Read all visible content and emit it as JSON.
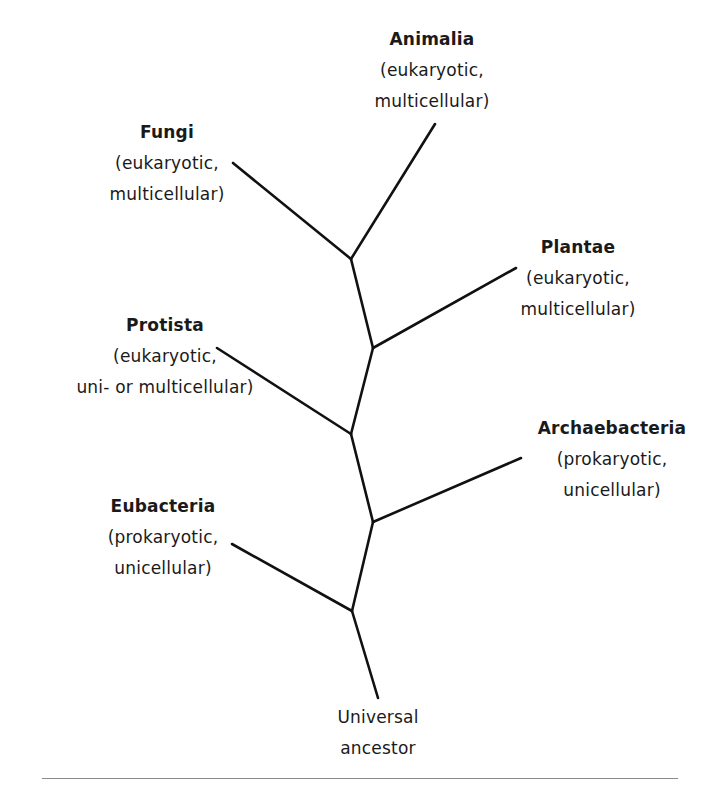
{
  "diagram": {
    "type": "phylogenetic-tree",
    "root": {
      "name": "Universal",
      "desc": "ancestor"
    },
    "kingdoms": [
      {
        "id": "animalia",
        "name": "Animalia",
        "line1": "(eukaryotic,",
        "line2": "multicellular)"
      },
      {
        "id": "fungi",
        "name": "Fungi",
        "line1": "(eukaryotic,",
        "line2": "multicellular)"
      },
      {
        "id": "plantae",
        "name": "Plantae",
        "line1": "(eukaryotic,",
        "line2": "multicellular)"
      },
      {
        "id": "protista",
        "name": "Protista",
        "line1": "(eukaryotic,",
        "line2": "uni- or multicellular)"
      },
      {
        "id": "archaebacteria",
        "name": "Archaebacteria",
        "line1": "(prokaryotic,",
        "line2": "unicellular)"
      },
      {
        "id": "eubacteria",
        "name": "Eubacteria",
        "line1": "(prokaryotic,",
        "line2": "unicellular)"
      }
    ],
    "branches": [
      {
        "from": "universal-ancestor",
        "to": "node-1"
      },
      {
        "from": "node-1",
        "to": "eubacteria"
      },
      {
        "from": "node-1",
        "to": "node-2"
      },
      {
        "from": "node-2",
        "to": "archaebacteria"
      },
      {
        "from": "node-2",
        "to": "node-3"
      },
      {
        "from": "node-3",
        "to": "protista"
      },
      {
        "from": "node-3",
        "to": "node-4"
      },
      {
        "from": "node-4",
        "to": "plantae"
      },
      {
        "from": "node-4",
        "to": "node-5"
      },
      {
        "from": "node-5",
        "to": "fungi"
      },
      {
        "from": "node-5",
        "to": "animalia"
      }
    ],
    "colors": {
      "line": "#111111",
      "text": "#1a1a1a",
      "rule": "#8a8a8a"
    }
  }
}
